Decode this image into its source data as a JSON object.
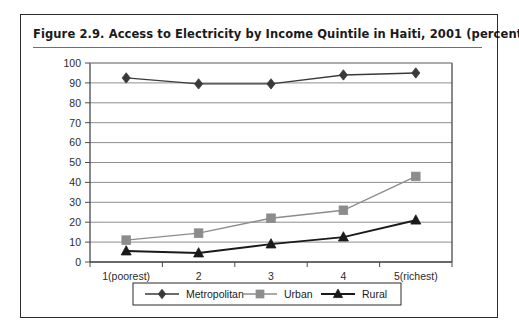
{
  "figure": {
    "title": "Figure 2.9.  Access to Electricity by Income Quintile in Haiti, 2001 (percent)"
  },
  "chart_data": {
    "type": "line",
    "title": "Figure 2.9.  Access to Electricity by Income Quintile in Haiti, 2001 (percent)",
    "xlabel": "",
    "ylabel": "",
    "categories": [
      "1(poorest)",
      "2",
      "3",
      "4",
      "5(richest)"
    ],
    "ylim": [
      0,
      100
    ],
    "ytick_step": 10,
    "yticks": [
      0,
      10,
      20,
      30,
      40,
      50,
      60,
      70,
      80,
      90,
      100
    ],
    "grid": true,
    "legend_position": "bottom",
    "series": [
      {
        "name": "Metropolitan",
        "marker": "diamond",
        "color": "#3a3a3a",
        "values": [
          92.5,
          89.5,
          89.5,
          94,
          95
        ]
      },
      {
        "name": "Urban",
        "marker": "square",
        "color": "#8c8c8c",
        "values": [
          11,
          14.5,
          22,
          26,
          43
        ]
      },
      {
        "name": "Rural",
        "marker": "triangle",
        "color": "#1a1a1a",
        "values": [
          5.5,
          4.5,
          9,
          12.5,
          21
        ]
      }
    ]
  },
  "colors": {
    "frame": "#2b2b2b",
    "gridline": "#8e8e8e",
    "axis": "#4a4a4a",
    "background": "#ffffff"
  }
}
